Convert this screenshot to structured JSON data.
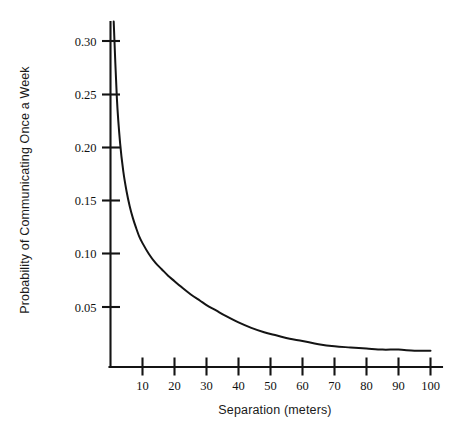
{
  "chart_data": {
    "type": "line",
    "title": "",
    "subtitle": "",
    "xlabel": "Separation (meters)",
    "ylabel": "Probability of Communicating Once a Week",
    "xlim": [
      0,
      108
    ],
    "ylim": [
      0,
      0.325
    ],
    "grid": false,
    "legend": null,
    "legend_position": "none",
    "annotations": [],
    "xticks": [
      10,
      20,
      30,
      40,
      50,
      60,
      70,
      80,
      90,
      100
    ],
    "xtick_labels": [
      "10",
      "20",
      "30",
      "40",
      "50",
      "60",
      "70",
      "80",
      "90",
      "100"
    ],
    "yticks": [
      0.05,
      0.1,
      0.15,
      0.2,
      0.25,
      0.3
    ],
    "ytick_labels": [
      "0.05",
      "0.10",
      "0.15",
      "0.20",
      "0.25",
      "0.30"
    ],
    "series": [
      {
        "name": "Probability of communicating once a week",
        "color": "#141414",
        "x": [
          1,
          2,
          3,
          4,
          5,
          6,
          7,
          8,
          9,
          10,
          12,
          14,
          16,
          18,
          20,
          22,
          25,
          28,
          30,
          33,
          36,
          40,
          44,
          48,
          52,
          56,
          60,
          65,
          70,
          75,
          80,
          85,
          90,
          95,
          100
        ],
        "y": [
          0.318,
          0.247,
          0.206,
          0.18,
          0.162,
          0.148,
          0.137,
          0.128,
          0.12,
          0.114,
          0.104,
          0.096,
          0.09,
          0.084,
          0.079,
          0.074,
          0.067,
          0.061,
          0.057,
          0.052,
          0.047,
          0.041,
          0.036,
          0.032,
          0.029,
          0.026,
          0.024,
          0.021,
          0.019,
          0.018,
          0.017,
          0.016,
          0.016,
          0.015,
          0.015
        ]
      }
    ]
  },
  "axes": {
    "y_axis_name": "y-axis",
    "x_axis_name": "x-axis"
  }
}
